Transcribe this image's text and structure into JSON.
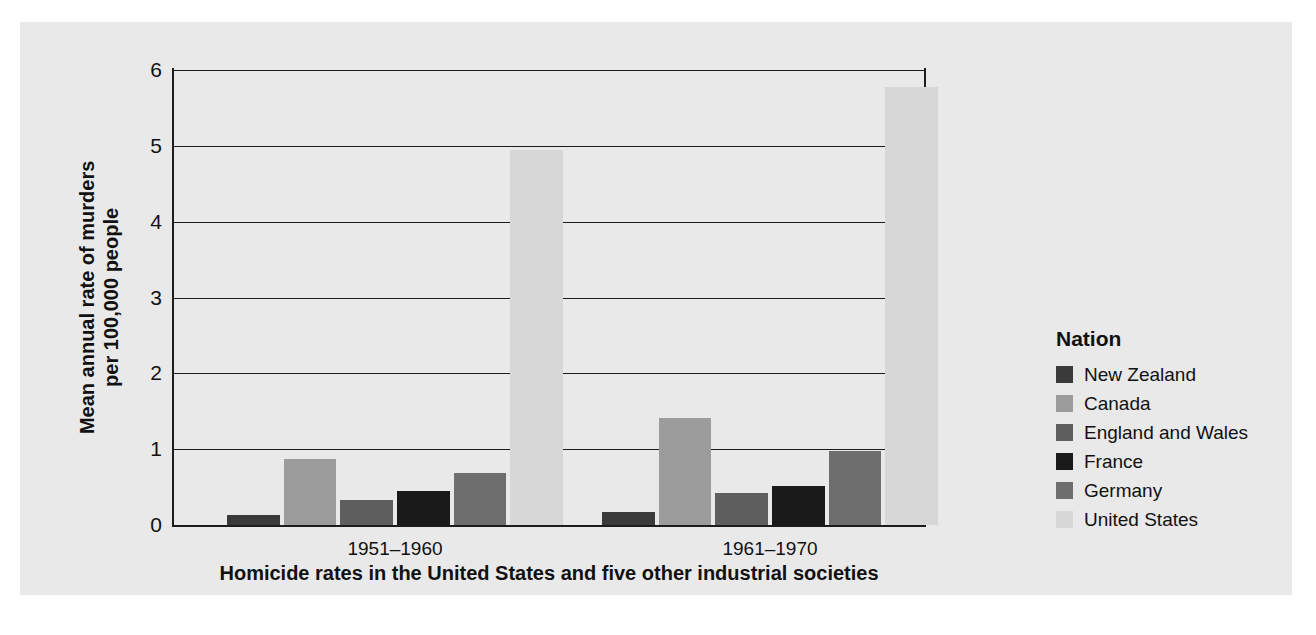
{
  "figure": {
    "caption": "Homicide rates in the United States and five other industrial societies",
    "background_color": "#e9e9e9",
    "axis_color": "#1c1c1c"
  },
  "legend": {
    "title": "Nation",
    "position": "right"
  },
  "chart_data": {
    "type": "bar",
    "title": "",
    "subtitle": "",
    "caption": "Homicide rates in the United States and five other industrial societies",
    "xlabel": "",
    "ylabel": "Mean annual rate of murders per 100,000 people",
    "ylabel_line1": "Mean annual rate of murders",
    "ylabel_line2": "per 100,000 people",
    "categories": [
      "1951–1960",
      "1961–1970"
    ],
    "ylim": [
      0,
      6
    ],
    "yticks": [
      0,
      1,
      2,
      3,
      4,
      5,
      6
    ],
    "ytick_labels": [
      "0",
      "1",
      "2",
      "3",
      "4",
      "5",
      "6"
    ],
    "grid": true,
    "grid_axis": "y",
    "legend_title": "Nation",
    "legend_position": "right",
    "series": [
      {
        "name": "New Zealand",
        "color": "#3a3a3a",
        "values": [
          0.13,
          0.17
        ]
      },
      {
        "name": "Canada",
        "color": "#9c9c9c",
        "values": [
          0.87,
          1.41
        ]
      },
      {
        "name": "England and Wales",
        "color": "#5e5e5e",
        "values": [
          0.33,
          0.42
        ]
      },
      {
        "name": "France",
        "color": "#1a1a1a",
        "values": [
          0.45,
          0.52
        ]
      },
      {
        "name": "Germany",
        "color": "#6e6e6e",
        "values": [
          0.68,
          0.97
        ]
      },
      {
        "name": "United States",
        "color": "#d7d7d7",
        "values": [
          4.95,
          5.78
        ]
      }
    ]
  }
}
